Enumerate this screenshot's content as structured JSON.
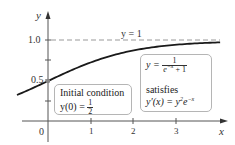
{
  "chart_data": {
    "type": "line",
    "title": "",
    "xlabel": "x",
    "ylabel": "y",
    "xlim": [
      -0.73,
      4.0
    ],
    "ylim": [
      0,
      1.12
    ],
    "x_ticks": [
      0,
      1,
      2,
      3
    ],
    "x_tick_labels": [
      "0",
      "1",
      "2",
      "3"
    ],
    "y_ticks": [
      0.25,
      0.5,
      0.75,
      1.0
    ],
    "y_tick_labels": [
      "",
      "0.5",
      "",
      "1.0"
    ],
    "grid": false,
    "series": [
      {
        "name": "y = 1/(e^{-x}+1)",
        "x": [
          -0.73,
          -0.5,
          0,
          0.5,
          1,
          1.5,
          2,
          2.5,
          3,
          3.5,
          4.0
        ],
        "values": [
          0.325,
          0.378,
          0.5,
          0.622,
          0.731,
          0.818,
          0.881,
          0.924,
          0.953,
          0.971,
          0.982
        ]
      },
      {
        "name": "asymptote y = 1",
        "x": [
          0,
          4.0
        ],
        "values": [
          1,
          1
        ],
        "style": "dashed"
      }
    ],
    "points": [
      {
        "x": 0,
        "y": 0.5,
        "label": "initial condition"
      }
    ],
    "annotations": {
      "asymptote_label": "y = 1",
      "initial_condition": {
        "line1": "Initial condition",
        "line2_lhs": "y(0) = ",
        "num": "1",
        "den": "2"
      },
      "solution": {
        "lhs": "y = ",
        "num": "1",
        "den": "e",
        "den_exp": "−x",
        "den_tail": " + 1",
        "line2": "satisfies",
        "line3_a": "y′(x) = y",
        "line3_sq": "2",
        "line3_b": "e",
        "line3_exp": "−x"
      }
    },
    "colors": {
      "curve": "#1a1a1a",
      "axis": "#555555",
      "dashed": "#999999",
      "point": "#888888",
      "box_border": "#b5b5b5"
    }
  },
  "labels": {
    "y_axis": "y",
    "x_axis": "x",
    "tick_1_0": "1.0",
    "tick_0_5": "0.5",
    "tick_x0": "0",
    "tick_x1": "1",
    "tick_x2": "2",
    "tick_x3": "3"
  }
}
